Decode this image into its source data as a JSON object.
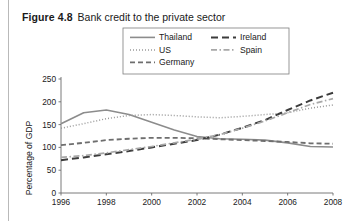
{
  "figure": {
    "label": "Figure 4.8",
    "title": "Bank credit to the private sector"
  },
  "chart_data": {
    "type": "line",
    "title": "Bank credit to the private sector",
    "xlabel": "",
    "ylabel": "Percentage of GDP",
    "xlim": [
      1996,
      2008
    ],
    "ylim": [
      0,
      250
    ],
    "ytick_values": [
      0,
      50,
      100,
      150,
      200,
      250
    ],
    "ytick_labels": [
      "0",
      "50",
      "100",
      "150",
      "200",
      "250"
    ],
    "xtick_values": [
      1996,
      1998,
      2000,
      2002,
      2004,
      2006,
      2008
    ],
    "xtick_labels": [
      "1996",
      "1998",
      "2000",
      "2002",
      "2004",
      "2006",
      "2008"
    ],
    "grid": false,
    "legend_position": "top-center",
    "x": [
      1996,
      1997,
      1998,
      1999,
      2000,
      2001,
      2002,
      2003,
      2004,
      2005,
      2006,
      2007,
      2008
    ],
    "series": [
      {
        "name": "Thailand",
        "style": "solid",
        "color": "#8c8c8c",
        "width": 1.6,
        "dash": "none",
        "values": [
          152,
          176,
          182,
          172,
          155,
          138,
          124,
          119,
          118,
          116,
          110,
          102,
          101
        ]
      },
      {
        "name": "US",
        "style": "dotted",
        "color": "#9a9a9a",
        "width": 1.5,
        "dash": "1,2",
        "values": [
          142,
          152,
          163,
          170,
          172,
          170,
          167,
          165,
          168,
          172,
          176,
          186,
          193
        ]
      },
      {
        "name": "Germany",
        "style": "dashed",
        "color": "#6e6e6e",
        "width": 1.8,
        "dash": "5,3",
        "values": [
          105,
          110,
          116,
          119,
          121,
          121,
          120,
          118,
          116,
          114,
          112,
          109,
          108
        ]
      },
      {
        "name": "Ireland",
        "style": "long-dash",
        "color": "#3c3c3c",
        "width": 2.0,
        "dash": "7,4",
        "values": [
          72,
          78,
          85,
          92,
          100,
          108,
          116,
          128,
          143,
          160,
          182,
          203,
          220
        ]
      },
      {
        "name": "Spain",
        "style": "dash-dot",
        "color": "#a8a8a8",
        "width": 1.7,
        "dash": "6,2.5,1.5,2.5",
        "values": [
          78,
          82,
          88,
          95,
          102,
          110,
          118,
          128,
          142,
          158,
          176,
          194,
          207
        ]
      }
    ]
  },
  "legend": {
    "entries": [
      {
        "label": "Thailand"
      },
      {
        "label": "Ireland"
      },
      {
        "label": "US"
      },
      {
        "label": "Spain"
      },
      {
        "label": "Germany"
      }
    ]
  }
}
